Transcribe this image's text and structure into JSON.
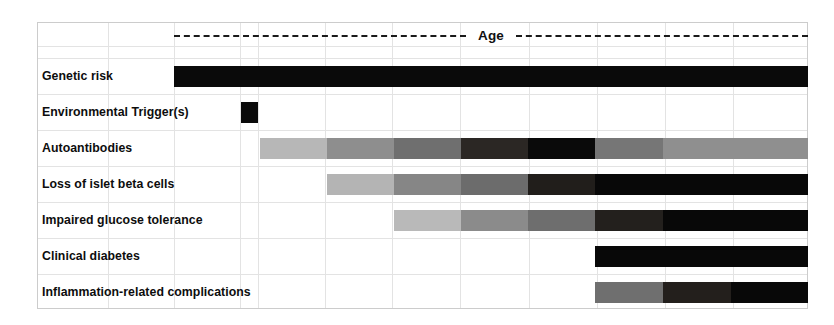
{
  "figure": {
    "title": "Age",
    "axis_label": "Age",
    "background": "#ffffff",
    "gridline_color": "#e3e3e3",
    "frame_color": "#cccccc"
  },
  "chart_data": {
    "type": "bar",
    "title": "Age",
    "xlabel": "Age",
    "ylabel": "",
    "grid": true,
    "legend": "none",
    "x_axis": {
      "label": "Age",
      "style": "dashed-arrow",
      "start_px": 174,
      "end_px": 808,
      "columns": 10
    },
    "categories": [
      "Genetic risk",
      "Environmental Trigger(s)",
      "Autoantibodies",
      "Loss of islet beta cells",
      "Impaired glucose tolerance",
      "Clinical diabetes",
      "Inflammation-related complications"
    ],
    "series": [
      {
        "name": "Genetic risk",
        "start": 0.0,
        "end": 1.0,
        "segments": [
          {
            "start": 0.0,
            "end": 1.0,
            "color": "#0a0a0a",
            "intensity": "maximal"
          }
        ]
      },
      {
        "name": "Environmental Trigger(s)",
        "start": 0.105,
        "end": 0.133,
        "segments": [
          {
            "start": 0.105,
            "end": 0.133,
            "color": "#0a0a0a",
            "intensity": "maximal"
          }
        ]
      },
      {
        "name": "Autoantibodies",
        "start": 0.136,
        "end": 1.0,
        "segments": [
          {
            "start": 0.136,
            "end": 0.241,
            "color": "#b7b7b7",
            "intensity": "very-low"
          },
          {
            "start": 0.241,
            "end": 0.347,
            "color": "#8e8e8e",
            "intensity": "low"
          },
          {
            "start": 0.347,
            "end": 0.453,
            "color": "#6f6f6f",
            "intensity": "medium"
          },
          {
            "start": 0.453,
            "end": 0.558,
            "color": "#2b2724",
            "intensity": "high"
          },
          {
            "start": 0.558,
            "end": 0.664,
            "color": "#0a0a0a",
            "intensity": "maximal"
          },
          {
            "start": 0.664,
            "end": 0.771,
            "color": "#767676",
            "intensity": "medium"
          },
          {
            "start": 0.771,
            "end": 1.0,
            "color": "#8f8f8f",
            "intensity": "low"
          }
        ]
      },
      {
        "name": "Loss of islet beta cells",
        "start": 0.241,
        "end": 1.0,
        "segments": [
          {
            "start": 0.241,
            "end": 0.347,
            "color": "#b4b4b4",
            "intensity": "very-low"
          },
          {
            "start": 0.347,
            "end": 0.453,
            "color": "#868686",
            "intensity": "low"
          },
          {
            "start": 0.453,
            "end": 0.558,
            "color": "#6c6c6c",
            "intensity": "medium"
          },
          {
            "start": 0.558,
            "end": 0.664,
            "color": "#211e1b",
            "intensity": "high"
          },
          {
            "start": 0.664,
            "end": 1.0,
            "color": "#080808",
            "intensity": "maximal"
          }
        ]
      },
      {
        "name": "Impaired glucose tolerance",
        "start": 0.347,
        "end": 1.0,
        "segments": [
          {
            "start": 0.347,
            "end": 0.453,
            "color": "#b9b9b9",
            "intensity": "very-low"
          },
          {
            "start": 0.453,
            "end": 0.558,
            "color": "#8b8b8b",
            "intensity": "low"
          },
          {
            "start": 0.558,
            "end": 0.664,
            "color": "#6e6e6e",
            "intensity": "medium"
          },
          {
            "start": 0.664,
            "end": 0.771,
            "color": "#23201d",
            "intensity": "high"
          },
          {
            "start": 0.771,
            "end": 1.0,
            "color": "#080808",
            "intensity": "maximal"
          }
        ]
      },
      {
        "name": "Clinical diabetes",
        "start": 0.664,
        "end": 1.0,
        "segments": [
          {
            "start": 0.664,
            "end": 1.0,
            "color": "#080808",
            "intensity": "maximal"
          }
        ]
      },
      {
        "name": "Inflammation-related complications",
        "start": 0.664,
        "end": 1.0,
        "segments": [
          {
            "start": 0.664,
            "end": 0.771,
            "color": "#6f6f6f",
            "intensity": "medium"
          },
          {
            "start": 0.771,
            "end": 0.878,
            "color": "#231f1c",
            "intensity": "high"
          },
          {
            "start": 0.878,
            "end": 1.0,
            "color": "#080808",
            "intensity": "maximal"
          }
        ]
      }
    ]
  },
  "rows": [
    {
      "label": "Genetic risk"
    },
    {
      "label": "Environmental Trigger(s)"
    },
    {
      "label": "Autoantibodies"
    },
    {
      "label": "Loss of islet beta cells"
    },
    {
      "label": "Impaired glucose tolerance"
    },
    {
      "label": "Clinical diabetes"
    },
    {
      "label": "Inflammation-related complications"
    }
  ]
}
